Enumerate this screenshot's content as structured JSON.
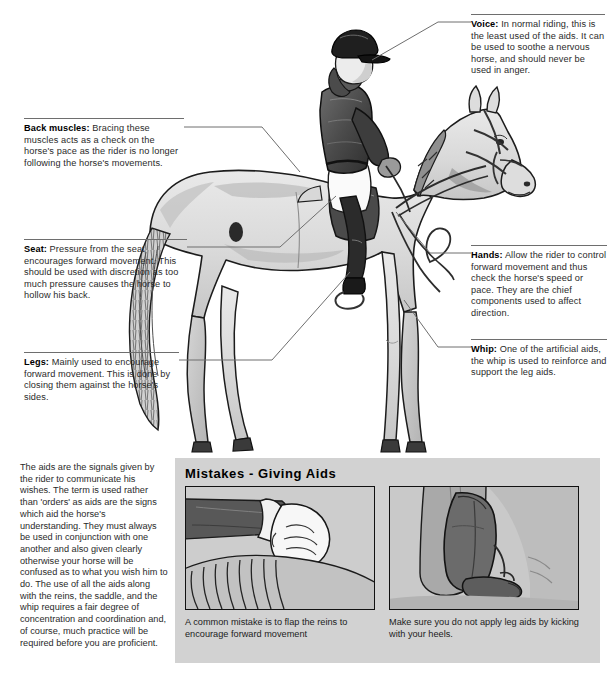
{
  "callouts": [
    {
      "id": "voice",
      "term": "Voice:",
      "text": " In normal riding, this is the least used of the aids. It can be used to soothe a nervous horse, and should never be used in anger."
    },
    {
      "id": "back-muscles",
      "term": "Back muscles:",
      "text": " Bracing these muscles acts as a check on the horse's pace as the rider is no longer following the horse's movements."
    },
    {
      "id": "seat",
      "term": "Seat:",
      "text": " Pressure from the seat encourages forward movement. This should be used with discretion as too much pressure causes the horse to hollow his back."
    },
    {
      "id": "legs",
      "term": "Legs:",
      "text": " Mainly used to encourage forward movement. This is done by closing them against the horse's sides."
    },
    {
      "id": "hands",
      "term": "Hands:",
      "text": " Allow the rider to control forward movement and thus check the horse's speed or pace. They are the chief components used to affect direction."
    },
    {
      "id": "whip",
      "term": "Whip:",
      "text": " One of the artificial aids, the whip is used to reinforce and support the leg aids."
    }
  ],
  "intro": {
    "text": "The aids are the signals given by the rider to communicate his wishes. The term is used rather than 'orders' as aids are the signs which aid the horse's understanding. They must always be used in conjunction with one another and also given clearly otherwise your horse will be confused as to what you wish him to do. The use of all the aids along with the reins, the saddle, and the whip requires a fair degree of concentration and coordination and, of course, much practice will be required before you are proficient."
  },
  "mistakes": {
    "title": "Mistakes - Giving Aids",
    "photos": [
      {
        "id": "flapping-reins",
        "caption": "A common mistake is to flap the reins to encourage forward movement"
      },
      {
        "id": "kicking-heels",
        "caption": "Make sure you do not apply leg aids by kicking with your heels."
      }
    ]
  },
  "artwork": {
    "main_illustration": "horse-and-rider-illustration",
    "photo_1": "hand-flapping-reins-illustration",
    "photo_2": "boot-kicking-heel-illustration"
  },
  "colors": {
    "background": "#ffffff",
    "panel": "#d2d2d2",
    "rule": "#6e6e6e",
    "text": "#2a2a2a",
    "ink": "#1b1b1b"
  }
}
